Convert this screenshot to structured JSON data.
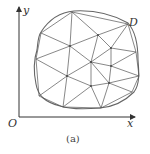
{
  "figure": {
    "caption": "(a)",
    "axes": {
      "origin_label": "O",
      "x_label": "x",
      "y_label": "y"
    },
    "region_label": "D",
    "colors": {
      "line": "#555555",
      "boundary": "#666666",
      "text": "#333333"
    }
  }
}
